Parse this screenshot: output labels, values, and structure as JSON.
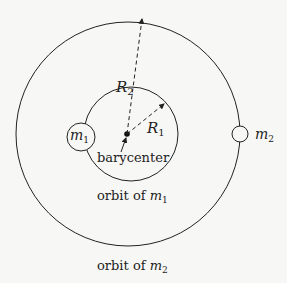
{
  "diagram": {
    "labels": {
      "m1": "m",
      "m1_sub": "1",
      "m2": "m",
      "m2_sub": "2",
      "R1": "R",
      "R1_sub": "1",
      "R2": "R",
      "R2_sub": "2",
      "barycenter": "barycenter",
      "orbit1": "orbit of ",
      "orbit1_m": "m",
      "orbit1_sub": "1",
      "orbit2": "orbit of ",
      "orbit2_m": "m",
      "orbit2_sub": "2"
    },
    "colors": {
      "line": "#222222",
      "background": "#f7f7f5"
    }
  }
}
